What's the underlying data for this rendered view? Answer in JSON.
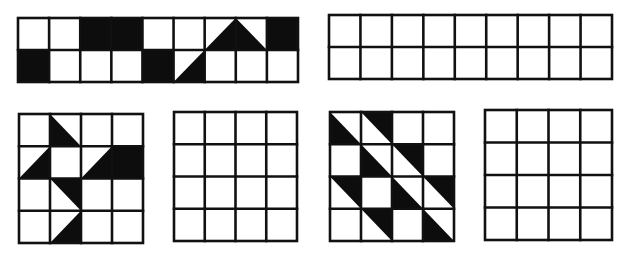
{
  "colors": {
    "ink": "#0d0d0d",
    "line": "#111111",
    "paper": "#ffffff"
  },
  "legend": {
    "cell_shapes": {
      "full": "fully shaded square",
      "ll": "triangle shaded: top-left, bottom-left, bottom-right",
      "lr": "triangle shaded: top-right, bottom-right, bottom-left",
      "ur": "triangle shaded: top-left, top-right, bottom-right",
      "ul": "triangle shaded: top-left, top-right, bottom-left"
    }
  },
  "grids": [
    {
      "id": "top-left-pattern",
      "x": 18,
      "y": 18,
      "width": 280,
      "height": 64,
      "cols": 9,
      "rows": 2,
      "cells": [
        {
          "r": 0,
          "c": 2,
          "shape": "full"
        },
        {
          "r": 0,
          "c": 3,
          "shape": "full"
        },
        {
          "r": 0,
          "c": 6,
          "shape": "lr"
        },
        {
          "r": 0,
          "c": 7,
          "shape": "ll"
        },
        {
          "r": 0,
          "c": 8,
          "shape": "full"
        },
        {
          "r": 1,
          "c": 0,
          "shape": "full"
        },
        {
          "r": 1,
          "c": 4,
          "shape": "full"
        },
        {
          "r": 1,
          "c": 5,
          "shape": "lr"
        }
      ]
    },
    {
      "id": "top-right-blank",
      "x": 329,
      "y": 15,
      "width": 283,
      "height": 64,
      "cols": 9,
      "rows": 2,
      "cells": []
    },
    {
      "id": "bottom-1-pattern",
      "x": 19,
      "y": 114,
      "width": 124,
      "height": 129,
      "cols": 4,
      "rows": 4,
      "cells": [
        {
          "r": 0,
          "c": 1,
          "shape": "ll"
        },
        {
          "r": 1,
          "c": 0,
          "shape": "lr"
        },
        {
          "r": 1,
          "c": 2,
          "shape": "lr"
        },
        {
          "r": 1,
          "c": 3,
          "shape": "full"
        },
        {
          "r": 2,
          "c": 1,
          "shape": "ur"
        },
        {
          "r": 3,
          "c": 1,
          "shape": "lr"
        }
      ]
    },
    {
      "id": "bottom-2-blank",
      "x": 174,
      "y": 112,
      "width": 123,
      "height": 129,
      "cols": 4,
      "rows": 4,
      "cells": []
    },
    {
      "id": "bottom-3-pattern",
      "x": 330,
      "y": 112,
      "width": 124,
      "height": 129,
      "cols": 4,
      "rows": 4,
      "cells": [
        {
          "r": 0,
          "c": 0,
          "shape": "ll"
        },
        {
          "r": 0,
          "c": 1,
          "shape": "ur"
        },
        {
          "r": 1,
          "c": 1,
          "shape": "ll"
        },
        {
          "r": 1,
          "c": 2,
          "shape": "ur"
        },
        {
          "r": 2,
          "c": 0,
          "shape": "ur"
        },
        {
          "r": 2,
          "c": 2,
          "shape": "ll"
        },
        {
          "r": 2,
          "c": 3,
          "shape": "ur"
        },
        {
          "r": 3,
          "c": 1,
          "shape": "ur"
        },
        {
          "r": 3,
          "c": 3,
          "shape": "ll"
        }
      ]
    },
    {
      "id": "bottom-4-blank",
      "x": 485,
      "y": 110,
      "width": 127,
      "height": 130,
      "cols": 4,
      "rows": 4,
      "cells": []
    }
  ]
}
